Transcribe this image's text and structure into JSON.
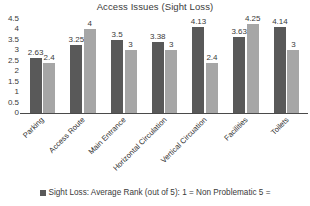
{
  "chart_data": {
    "type": "bar",
    "title": "Access Issues (Sight Loss)",
    "xlabel": "",
    "ylabel": "",
    "ylim": [
      0,
      4.5
    ],
    "grid": false,
    "legend_position": "bottom",
    "yticks": [
      "4.5",
      "4",
      "3.5",
      "3",
      "2.5",
      "2",
      "1.5",
      "1",
      "0.5",
      "0"
    ],
    "ytick_values": [
      4.5,
      4,
      3.5,
      3,
      2.5,
      2,
      1.5,
      1,
      0.5,
      0
    ],
    "categories": [
      "Parking",
      "Access Route",
      "Main Entrance",
      "Horizontal Circulation",
      "Vertical Circuation",
      "Facilities",
      "Toilets"
    ],
    "series": [
      {
        "name": "Sight Loss: Average Rank (out of 5): 1 = Non Problematic 5 =",
        "color": "#595959",
        "values": [
          2.63,
          3.25,
          3.5,
          3.38,
          4.13,
          3.63,
          4.14
        ],
        "labels": [
          "2.63",
          "3.25",
          "3.5",
          "3.38",
          "4.13",
          "3.63",
          "4.14"
        ]
      },
      {
        "name": "",
        "color": "#a6a6a6",
        "values": [
          2.4,
          4,
          3,
          3,
          2.4,
          4.25,
          3
        ],
        "labels": [
          "2.4",
          "4",
          "3",
          "3",
          "2.4",
          "4.25",
          "3"
        ]
      }
    ],
    "legend": [
      {
        "label": "Sight Loss: Average Rank (out of 5): 1 = Non Problematic 5 =",
        "color": "#595959"
      }
    ]
  }
}
